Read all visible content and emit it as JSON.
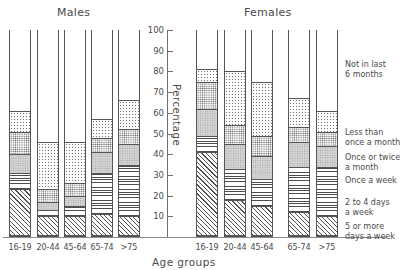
{
  "panels": {
    "males_title": "Males",
    "females_title": "Females"
  },
  "axis": {
    "ylabel": "Percentage",
    "xlabel": "Age groups",
    "yticks": [
      "100",
      "90",
      "80",
      "70",
      "60",
      "50",
      "40",
      "30",
      "20",
      "10"
    ],
    "ymin": 0,
    "ymax": 100,
    "categories": [
      "16-19",
      "20-44",
      "45-64",
      "65-74",
      ">75"
    ]
  },
  "legend": {
    "items": [
      {
        "label": "Not in last\n6 months",
        "line1": "Not in last",
        "line2": "6 months",
        "fill": "none"
      },
      {
        "label": "Less than\nonce a month",
        "line1": "Less than",
        "line2": "once a month",
        "fill": "finedots"
      },
      {
        "label": "Once or twice\na month",
        "line1": "Once or twice",
        "line2": "a month",
        "fill": "dots"
      },
      {
        "label": "Once a week",
        "line1": "Once a week",
        "line2": "",
        "fill": "gray"
      },
      {
        "label": "2 to 4 days\na week",
        "line1": "2 to 4 days",
        "line2": "a week",
        "fill": "hlines"
      },
      {
        "label": "5 or more\ndays a week",
        "line1": "5 or more",
        "line2": "days a week",
        "fill": "diag"
      }
    ]
  },
  "chart_data": {
    "type": "bar",
    "subtype": "stacked-percentage",
    "title": "",
    "xlabel": "Age groups",
    "ylabel": "Percentage",
    "ylim": [
      0,
      100
    ],
    "grid": false,
    "legend_position": "right",
    "categories": [
      "16-19",
      "20-44",
      "45-64",
      "65-74",
      ">75"
    ],
    "panels": [
      "Males",
      "Females"
    ],
    "series": [
      {
        "name": "5 or more days a week",
        "fill": "diag",
        "Males": [
          22,
          9,
          9,
          10,
          9
        ],
        "Females": [
          40,
          17,
          14,
          11,
          9
        ]
      },
      {
        "name": "2 to 4 days a week",
        "fill": "hlines",
        "Males": [
          8,
          3,
          5,
          20,
          25
        ],
        "Females": [
          8,
          15,
          13,
          22,
          24
        ]
      },
      {
        "name": "Once a week",
        "fill": "gray",
        "Males": [
          9,
          4,
          5,
          10,
          10
        ],
        "Females": [
          13,
          12,
          11,
          12,
          10
        ]
      },
      {
        "name": "Once or twice a month",
        "fill": "dots",
        "Males": [
          11,
          6,
          6,
          7,
          7
        ],
        "Females": [
          13,
          9,
          10,
          7,
          7
        ]
      },
      {
        "name": "Less than once a month",
        "fill": "finedots",
        "Males": [
          10,
          23,
          20,
          9,
          14
        ],
        "Females": [
          6,
          26,
          26,
          14,
          10
        ]
      },
      {
        "name": "Not in last 6 months",
        "fill": "none",
        "Males": [
          40,
          55,
          55,
          44,
          35
        ],
        "Females": [
          20,
          21,
          26,
          34,
          40
        ]
      }
    ]
  }
}
